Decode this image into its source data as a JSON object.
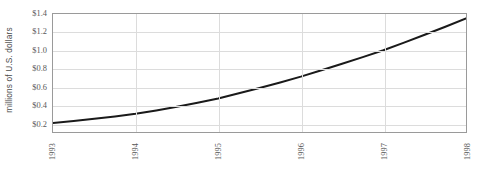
{
  "chart_data": {
    "type": "line",
    "title": "",
    "subtitle": "",
    "xlabel": "",
    "ylabel": "millions of U.S. dollars",
    "x": [
      1993,
      1994,
      1995,
      1996,
      1997,
      1998
    ],
    "xtick_labels": [
      "1993",
      "1994",
      "1995",
      "1996",
      "1997",
      "1998"
    ],
    "ytick_labels": [
      "$1.4",
      "$1.2",
      "$1.0",
      "$0.8",
      "$0.6",
      "$0.4",
      "$0.2"
    ],
    "ytick_values": [
      1.4,
      1.2,
      1.0,
      0.8,
      0.6,
      0.4,
      0.2
    ],
    "xlim": [
      1993,
      1998
    ],
    "ylim": [
      0.1,
      1.4
    ],
    "grid": "horizontal-and-vertical",
    "legend": "none",
    "series": [
      {
        "name": "value",
        "color": "#1a1a1a",
        "line_width": 2,
        "values": [
          0.2,
          0.3,
          0.47,
          0.71,
          1.0,
          1.35
        ]
      }
    ],
    "dense_points": {
      "x": [
        1993.0,
        1993.25,
        1993.5,
        1993.75,
        1994.0,
        1994.25,
        1994.5,
        1994.75,
        1995.0,
        1995.25,
        1995.5,
        1995.75,
        1996.0,
        1996.25,
        1996.5,
        1996.75,
        1997.0,
        1997.25,
        1997.5,
        1997.75,
        1998.0
      ],
      "y": [
        0.2,
        0.222,
        0.246,
        0.272,
        0.3,
        0.338,
        0.379,
        0.423,
        0.47,
        0.526,
        0.585,
        0.646,
        0.71,
        0.78,
        0.852,
        0.925,
        1.0,
        1.085,
        1.172,
        1.26,
        1.35
      ]
    }
  },
  "axes": {
    "y_title": "millions of U.S. dollars",
    "frame_color": "#9a9a9a",
    "grid_color": "#dcdcdc",
    "tick_text_color": "#585858"
  }
}
